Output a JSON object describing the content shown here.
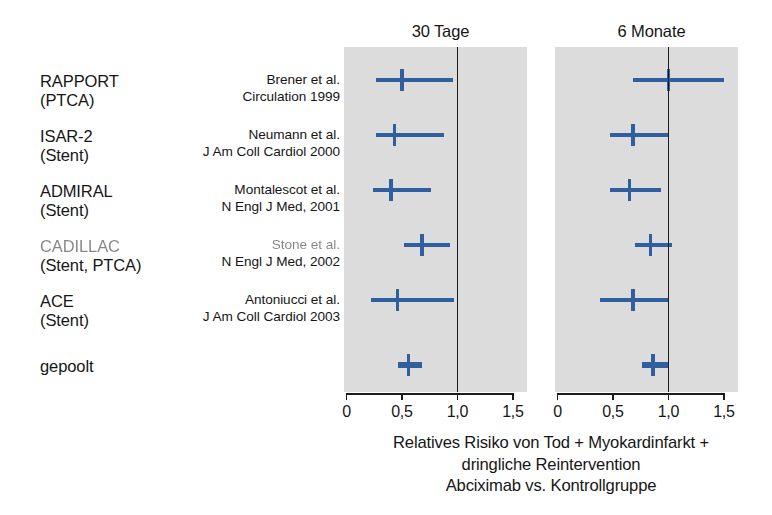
{
  "figure": {
    "caption_lines": [
      "Relatives Risiko von Tod + Myokardinfarkt +",
      "dringliche Reintervention",
      "Abciximab vs. Kontrollgruppe"
    ],
    "panel_background": "#dcdcdc",
    "marker_color": "#2f5f9e",
    "reference_line_color": "#1b1b1b"
  },
  "studies": [
    {
      "name": "RAPPORT",
      "subtitle": "(PTCA)",
      "author": "Brener et al.",
      "journal": "Circulation 1999"
    },
    {
      "name": "ISAR-2",
      "subtitle": "(Stent)",
      "author": "Neumann et al.",
      "journal": "J Am Coll Cardiol 2000"
    },
    {
      "name": "ADMIRAL",
      "subtitle": "(Stent)",
      "author": "Montalescot et al.",
      "journal": "N Engl J Med, 2001"
    },
    {
      "name": "CADILLAC",
      "subtitle": "(Stent, PTCA)",
      "author": "Stone et al.",
      "journal": "N Engl J Med, 2002"
    },
    {
      "name": "ACE",
      "subtitle": "(Stent)",
      "author": "Antoniucci et al.",
      "journal": "J Am Coll Cardiol 2003"
    },
    {
      "name": "gepoolt",
      "subtitle": "",
      "author": "",
      "journal": ""
    }
  ],
  "chart_data": {
    "type": "forest",
    "subtitle": "Abciximab vs. Kontrollgruppe",
    "xlabel": "Relatives Risiko",
    "xlim": [
      0,
      1.5
    ],
    "xticks": [
      0,
      0.5,
      1.0,
      1.5
    ],
    "xticklabels": [
      "0",
      "0,5",
      "1,0",
      "1,5"
    ],
    "reference_value": 1.0,
    "grid": false,
    "legend": "none",
    "categories": [
      "RAPPORT",
      "ISAR-2",
      "ADMIRAL",
      "CADILLAC",
      "ACE",
      "gepoolt"
    ],
    "panels": [
      {
        "label": "30 Tage",
        "points": [
          {
            "study": "RAPPORT",
            "estimate": 0.5,
            "ci_low": 0.27,
            "ci_high": 0.96,
            "pooled": false
          },
          {
            "study": "ISAR-2",
            "estimate": 0.43,
            "ci_low": 0.27,
            "ci_high": 0.88,
            "pooled": false
          },
          {
            "study": "ADMIRAL",
            "estimate": 0.4,
            "ci_low": 0.24,
            "ci_high": 0.76,
            "pooled": false
          },
          {
            "study": "CADILLAC",
            "estimate": 0.68,
            "ci_low": 0.52,
            "ci_high": 0.93,
            "pooled": false
          },
          {
            "study": "ACE",
            "estimate": 0.46,
            "ci_low": 0.22,
            "ci_high": 0.97,
            "pooled": false
          },
          {
            "study": "gepoolt",
            "estimate": 0.56,
            "ci_low": 0.46,
            "ci_high": 0.68,
            "pooled": true
          }
        ]
      },
      {
        "label": "6 Monate",
        "points": [
          {
            "study": "RAPPORT",
            "estimate": 1.0,
            "ci_low": 0.68,
            "ci_high": 1.5,
            "pooled": false
          },
          {
            "study": "ISAR-2",
            "estimate": 0.68,
            "ci_low": 0.47,
            "ci_high": 1.0,
            "pooled": false
          },
          {
            "study": "ADMIRAL",
            "estimate": 0.65,
            "ci_low": 0.47,
            "ci_high": 0.93,
            "pooled": false
          },
          {
            "study": "CADILLAC",
            "estimate": 0.84,
            "ci_low": 0.7,
            "ci_high": 1.03,
            "pooled": false
          },
          {
            "study": "ACE",
            "estimate": 0.68,
            "ci_low": 0.38,
            "ci_high": 1.0,
            "pooled": false
          },
          {
            "study": "gepoolt",
            "estimate": 0.86,
            "ci_low": 0.76,
            "ci_high": 1.0,
            "pooled": true
          }
        ]
      }
    ]
  }
}
